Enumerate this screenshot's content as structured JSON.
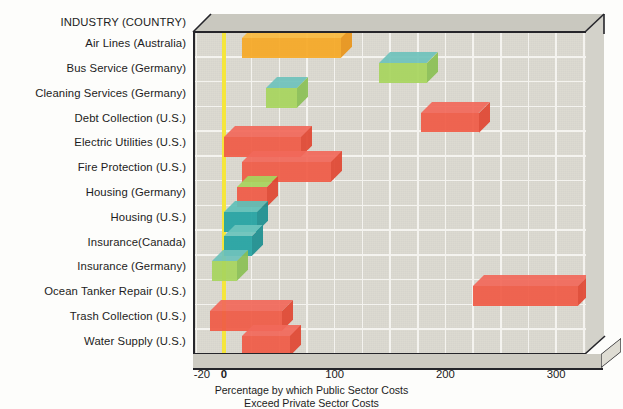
{
  "chart_data": {
    "type": "bar",
    "orientation": "horizontal",
    "title": "",
    "header_label": "INDUSTRY (COUNTRY)",
    "xlabel": "Percentage by which Public Sector Costs Exceed Private Sector Costs",
    "xlabel_line1": "Percentage by which Public Sector Costs",
    "xlabel_line2": "Exceed Private Sector Costs",
    "ylabel": "",
    "xlim": [
      -28,
      327
    ],
    "xticks": [
      -20,
      0,
      100,
      200,
      300
    ],
    "xticklabels": [
      "-20",
      "0",
      "100",
      "200",
      "300"
    ],
    "gridlines_x": [
      -25,
      0,
      25,
      50,
      75,
      100,
      125,
      150,
      175,
      200,
      225,
      250,
      275,
      300,
      325
    ],
    "grid": true,
    "legend": "none",
    "zero_reference_line": 0,
    "zero_line_color": "#f5e63c",
    "categories": [
      "Air Lines (Australia)",
      "Bus Service (Germany)",
      "Cleaning Services (Germany)",
      "Debt Collection (U.S.)",
      "Electric Utilities (U.S.)",
      "Fire Protection (U.S.)",
      "Housing (Germany)",
      "Housing (U.S.)",
      "Insurance(Canada)",
      "Insurance (Germany)",
      "Ocean Tanker Repair (U.S.)",
      "Trash Collection (U.S.)",
      "Water Supply (U.S.)"
    ],
    "bars": [
      {
        "label": "Air Lines (Australia)",
        "low": 16,
        "high": 106,
        "color": "#f5a826",
        "top_color": "#f9b93e",
        "side_color": "#e8941b"
      },
      {
        "label": "Bus Service (Germany)",
        "low": 140,
        "high": 183,
        "color": "#a7d45e",
        "top_color": "#6fc2bb",
        "side_color": "#8bbf55"
      },
      {
        "label": "Cleaning Services (Germany)",
        "low": 38,
        "high": 66,
        "color": "#a7d45e",
        "top_color": "#6fc2bb",
        "side_color": "#8bbf55"
      },
      {
        "label": "Debt Collection (U.S.)",
        "low": 178,
        "high": 230,
        "color": "#ef5a46",
        "top_color": "#f1685a",
        "side_color": "#e04733"
      },
      {
        "label": "Electric Utilities (U.S.)",
        "low": 0,
        "high": 70,
        "color": "#ef5a46",
        "top_color": "#f1685a",
        "side_color": "#e04733"
      },
      {
        "label": "Fire Protection (U.S.)",
        "low": 16,
        "high": 97,
        "color": "#ef5a46",
        "top_color": "#f1685a",
        "side_color": "#e04733"
      },
      {
        "label": "Housing (Germany)",
        "low": 12,
        "high": 39,
        "color": "#ef5a46",
        "top_color": "#a7d45e",
        "side_color": "#e04733"
      },
      {
        "label": "Housing (U.S.)",
        "low": 0,
        "high": 30,
        "color": "#23a3a3",
        "top_color": "#5fc0b8",
        "side_color": "#1d8f90"
      },
      {
        "label": "Insurance(Canada)",
        "low": 0,
        "high": 25,
        "color": "#23a3a3",
        "top_color": "#6cc4bc",
        "side_color": "#1d8f90"
      },
      {
        "label": "Insurance (Germany)",
        "low": -11,
        "high": 12,
        "color": "#a7d45e",
        "top_color": "#6fc2bb",
        "side_color": "#8bbf55"
      },
      {
        "label": "Ocean Tanker Repair (U.S.)",
        "low": 225,
        "high": 320,
        "color": "#ef5a46",
        "top_color": "#f1685a",
        "side_color": "#e04733"
      },
      {
        "label": "Trash Collection (U.S.)",
        "low": -13,
        "high": 52,
        "color": "#ef5a46",
        "top_color": "#f1685a",
        "side_color": "#e04733"
      },
      {
        "label": "Water Supply (U.S.)",
        "low": 16,
        "high": 60,
        "color": "#ef5a46",
        "top_color": "#f1685a",
        "side_color": "#e04733"
      }
    ]
  },
  "axis": {
    "tick_minus20": "-20",
    "tick_0": "0",
    "tick_100": "100",
    "tick_200": "200",
    "tick_300": "300"
  },
  "header": {
    "industry_country": "INDUSTRY (COUNTRY)"
  },
  "caption": {
    "line1": "Percentage by which Public Sector Costs",
    "line2": "Exceed Private Sector Costs"
  },
  "colors": {
    "panel": "#dcdad1",
    "grid": "#f4f3ef",
    "zero": "#f5e63c",
    "red": "#ef5a46",
    "orange": "#f5a826",
    "green": "#a7d45e",
    "teal": "#23a3a3",
    "frame": "#25252a"
  }
}
